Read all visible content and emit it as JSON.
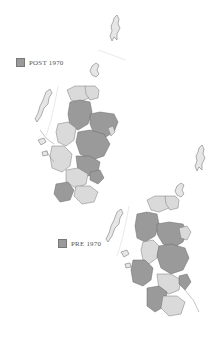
{
  "maps": [
    {
      "id": "post-1970",
      "legend_label": "POST 1970",
      "swatch_color": "#9a9a9a"
    },
    {
      "id": "pre-1970",
      "legend_label": "PRE 1970",
      "swatch_color": "#9a9a9a"
    }
  ],
  "colors": {
    "highlighted_region": "#9a9a9a",
    "other_region": "#dadada",
    "border": "#6a6a6a",
    "background": "#ffffff"
  }
}
